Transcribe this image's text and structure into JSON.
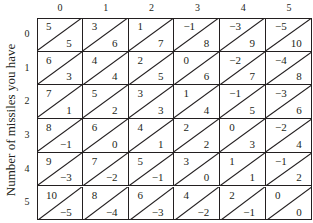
{
  "y_axis_label": "Number of missiles you have",
  "column_headers": [
    "0",
    "1",
    "2",
    "3",
    "4",
    "5"
  ],
  "row_headers": [
    "0",
    "1",
    "2",
    "3",
    "4",
    "5"
  ],
  "cells": [
    [
      {
        "upper": "5",
        "lower": "5"
      },
      {
        "upper": "3",
        "lower": "6"
      },
      {
        "upper": "1",
        "lower": "7"
      },
      {
        "upper": "−1",
        "lower": "8"
      },
      {
        "upper": "−3",
        "lower": "9"
      },
      {
        "upper": "−5",
        "lower": "10"
      }
    ],
    [
      {
        "upper": "6",
        "lower": "3"
      },
      {
        "upper": "4",
        "lower": "4"
      },
      {
        "upper": "2",
        "lower": "5"
      },
      {
        "upper": "0",
        "lower": "6"
      },
      {
        "upper": "−2",
        "lower": "7"
      },
      {
        "upper": "−4",
        "lower": "8"
      }
    ],
    [
      {
        "upper": "7",
        "lower": "1"
      },
      {
        "upper": "5",
        "lower": "2"
      },
      {
        "upper": "3",
        "lower": "3"
      },
      {
        "upper": "1",
        "lower": "4"
      },
      {
        "upper": "−1",
        "lower": "5"
      },
      {
        "upper": "−3",
        "lower": "6"
      }
    ],
    [
      {
        "upper": "8",
        "lower": "−1"
      },
      {
        "upper": "6",
        "lower": "0"
      },
      {
        "upper": "4",
        "lower": "1"
      },
      {
        "upper": "2",
        "lower": "2"
      },
      {
        "upper": "0",
        "lower": "3"
      },
      {
        "upper": "−2",
        "lower": "4"
      }
    ],
    [
      {
        "upper": "9",
        "lower": "−3"
      },
      {
        "upper": "7",
        "lower": "−2"
      },
      {
        "upper": "5",
        "lower": "−1"
      },
      {
        "upper": "3",
        "lower": "0"
      },
      {
        "upper": "1",
        "lower": "1"
      },
      {
        "upper": "−1",
        "lower": "2"
      }
    ],
    [
      {
        "upper": "10",
        "lower": "−5"
      },
      {
        "upper": "8",
        "lower": "−4"
      },
      {
        "upper": "6",
        "lower": "−3"
      },
      {
        "upper": "4",
        "lower": "−2"
      },
      {
        "upper": "2",
        "lower": "−1"
      },
      {
        "upper": "0",
        "lower": "0"
      }
    ]
  ],
  "colors": {
    "ink": "#231f20",
    "background": "#ffffff"
  }
}
